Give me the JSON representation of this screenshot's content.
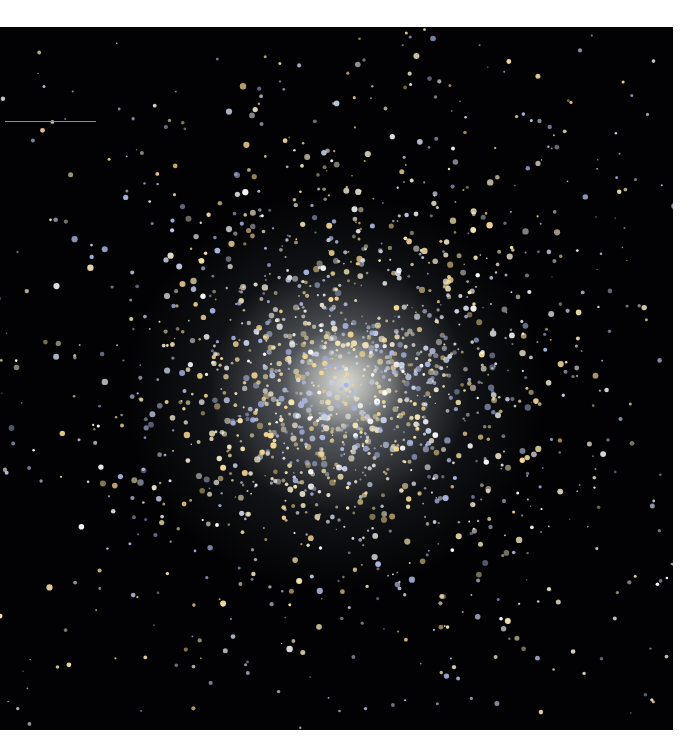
{
  "image": {
    "subject": "globular star cluster",
    "background_color": "#020204",
    "frame": {
      "left": 0,
      "top": 27,
      "width": 673,
      "height": 703
    },
    "core_center": [
      345,
      355
    ],
    "star_colors": [
      "#f2e6b0",
      "#e8e0c8",
      "#c8d0e8",
      "#aab4e0",
      "#ffffff",
      "#f5d890"
    ],
    "star_count": 1800,
    "scale_line": {
      "x1": 5,
      "x2": 96,
      "y": 121,
      "color": "#8a8a8a"
    }
  }
}
